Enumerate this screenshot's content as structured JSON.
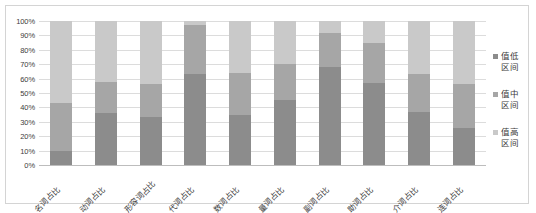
{
  "chart_data": {
    "type": "bar",
    "subtype": "stacked-percent",
    "title": "",
    "xlabel": "",
    "ylabel": "",
    "ylim": [
      0,
      100
    ],
    "ytick_labels": [
      "100%",
      "90%",
      "80%",
      "70%",
      "60%",
      "50%",
      "40%",
      "30%",
      "20%",
      "10%",
      "0%"
    ],
    "ytick_values": [
      100,
      90,
      80,
      70,
      60,
      50,
      40,
      30,
      20,
      10,
      0
    ],
    "grid": true,
    "legend_position": "right",
    "categories": [
      "名词占比",
      "动词占比",
      "形容词占比",
      "代词占比",
      "数词占比",
      "量词占比",
      "副词占比",
      "助词占比",
      "介词占比",
      "连词占比"
    ],
    "series": [
      {
        "name": "值高区间",
        "color": "#8c8c8c",
        "values": [
          10,
          36,
          33,
          63,
          35,
          45,
          68,
          57,
          37,
          26
        ]
      },
      {
        "name": "值中区间",
        "color": "#a6a6a6",
        "values": [
          33,
          22,
          23,
          34,
          29,
          25,
          24,
          28,
          26,
          30
        ]
      },
      {
        "name": "值低区间",
        "color": "#c9c9c9",
        "values": [
          57,
          42,
          44,
          3,
          36,
          30,
          8,
          15,
          37,
          44
        ]
      }
    ],
    "legend": [
      {
        "label_line1": "值低",
        "label_line2": "区间",
        "color": "#8c8c8c"
      },
      {
        "label_line1": "值中",
        "label_line2": "区间",
        "color": "#a6a6a6"
      },
      {
        "label_line1": "值高",
        "label_line2": "区间",
        "color": "#c9c9c9"
      }
    ]
  },
  "colors": {
    "frame_border": "#d4d4d4",
    "gridline": "#dcdcdc",
    "text": "#3c3c3c",
    "plot_background": "#ffffff"
  }
}
